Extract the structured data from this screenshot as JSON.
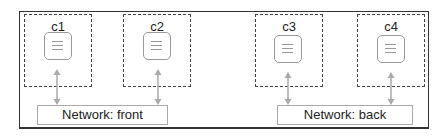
{
  "diagram": {
    "hosts": [
      {
        "label": "c1"
      },
      {
        "label": "c2"
      },
      {
        "label": "c3"
      },
      {
        "label": "c4"
      }
    ],
    "networks": [
      {
        "label": "Network: front"
      },
      {
        "label": "Network: back"
      }
    ],
    "colors": {
      "border": "#333333",
      "dashed": "#444444",
      "icon": "#999999",
      "arrow": "#aaaaaa"
    }
  }
}
